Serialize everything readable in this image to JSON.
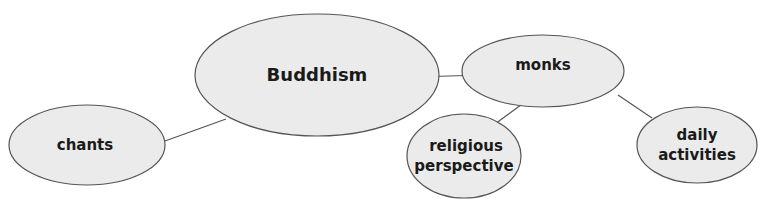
{
  "diagram": {
    "type": "concept-map",
    "colors": {
      "node_fill": "#ebebeb",
      "node_stroke": "#555555",
      "edge": "#555555",
      "text": "#1a1a1a"
    },
    "nodes": [
      {
        "id": "buddhism",
        "label": "Buddhism",
        "lines": [
          "Buddhism"
        ]
      },
      {
        "id": "chants",
        "label": "chants",
        "lines": [
          "chants"
        ]
      },
      {
        "id": "monks",
        "label": "monks",
        "lines": [
          "monks"
        ]
      },
      {
        "id": "religious-perspective",
        "label": "religious perspective",
        "lines": [
          "religious",
          "perspective"
        ]
      },
      {
        "id": "daily-activities",
        "label": "daily activities",
        "lines": [
          "daily",
          "activities"
        ]
      }
    ],
    "edges": [
      {
        "from": "buddhism",
        "to": "chants"
      },
      {
        "from": "buddhism",
        "to": "monks"
      },
      {
        "from": "monks",
        "to": "religious-perspective"
      },
      {
        "from": "monks",
        "to": "daily-activities"
      }
    ]
  }
}
